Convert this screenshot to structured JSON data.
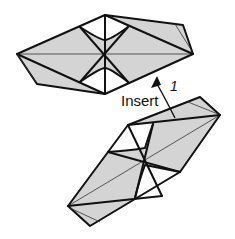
{
  "diagram": {
    "instruction_label": "Insert",
    "step_number": "1",
    "colors": {
      "paper_fill": "#d4d4d4",
      "line": "#111111",
      "background": "#ffffff"
    },
    "parts": [
      {
        "name": "top-folded-unit",
        "orientation": "horizontal"
      },
      {
        "name": "bottom-folded-unit",
        "orientation": "diagonal"
      }
    ],
    "arrow": {
      "direction": "up",
      "from": "bottom-folded-unit",
      "to": "top-folded-unit"
    }
  }
}
